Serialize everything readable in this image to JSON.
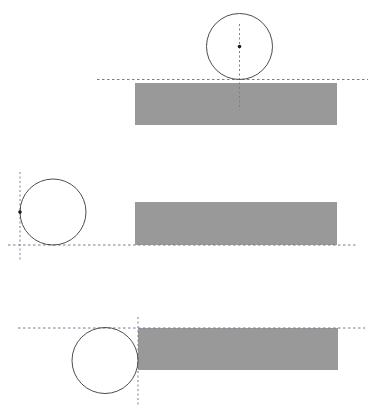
{
  "figure": {
    "width": 380,
    "height": 410,
    "background_color": "#ffffff",
    "rect_fill_color": "#999999",
    "circle_stroke_color": "#4d4d4d",
    "guide_line_color": "#7a7a99",
    "center_dot_color": "#1a1a1a",
    "panels": [
      {
        "id": "panel-top",
        "name": "circle-above-rectangle-top-edge",
        "description": "Circle tangent from above to the rectangle top edge; vertical guide through circle center",
        "rectangle": {
          "x": 135,
          "y": 83,
          "width": 202,
          "height": 42
        },
        "circle": {
          "cx": 239.5,
          "cy": 46.5,
          "r": 33
        },
        "center_dot": {
          "cx": 239.5,
          "cy": 46.5,
          "r": 1.8
        },
        "guides": [
          {
            "orientation": "horizontal",
            "y": 79.5,
            "x1": 97,
            "x2": 368
          },
          {
            "orientation": "vertical",
            "x": 239.5,
            "y1": 24,
            "y2": 110
          }
        ]
      },
      {
        "id": "panel-middle",
        "name": "circle-left-of-rectangle-bottom-edge",
        "description": "Circle tangent from above to the rectangle bottom-edge line, positioned left of the rectangle",
        "rectangle": {
          "x": 135,
          "y": 202,
          "width": 202,
          "height": 43
        },
        "circle": {
          "cx": 53,
          "cy": 212,
          "r": 33
        },
        "center_dot": {
          "cx": 20,
          "cy": 212,
          "r": 1.8
        },
        "guides": [
          {
            "orientation": "horizontal",
            "y": 245,
            "x1": 8,
            "x2": 358
          },
          {
            "orientation": "vertical",
            "x": 20,
            "y1": 172,
            "y2": 262
          }
        ]
      },
      {
        "id": "panel-bottom",
        "name": "circle-at-rectangle-top-left-corner",
        "description": "Circle tangent to the rectangle left edge and top edge at the top-left corner",
        "rectangle": {
          "x": 138,
          "y": 328,
          "width": 200,
          "height": 42
        },
        "circle": {
          "cx": 105,
          "cy": 360.5,
          "r": 33
        },
        "center_dot": {
          "cx": 105,
          "cy": 360.5,
          "r": 0
        },
        "guides": [
          {
            "orientation": "horizontal",
            "y": 328,
            "x1": 18,
            "x2": 365
          },
          {
            "orientation": "vertical",
            "x": 138,
            "y1": 317,
            "y2": 405
          }
        ]
      }
    ]
  }
}
